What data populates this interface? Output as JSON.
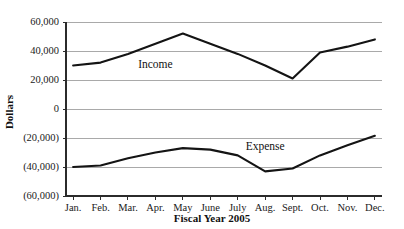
{
  "chart_data": {
    "type": "line",
    "title": "",
    "xlabel": "Fiscal Year 2005",
    "ylabel": "Dollars",
    "categories": [
      "Jan.",
      "Feb.",
      "Mar.",
      "Apr.",
      "May",
      "June",
      "July",
      "Aug.",
      "Sept.",
      "Oct.",
      "Nov.",
      "Dec."
    ],
    "ylim": [
      -60000,
      60000
    ],
    "ytick_values": [
      60000,
      40000,
      20000,
      0,
      -20000,
      -40000,
      -60000
    ],
    "ytick_labels": [
      "60,000",
      "40,000",
      "20,000",
      "0",
      "(20,000)",
      "(40,000)",
      "(60,000)"
    ],
    "grid": true,
    "legend": "inline-labels",
    "series": [
      {
        "name": "Income",
        "label_x_category": "Apr.",
        "label_value": 28000,
        "values": [
          30000,
          32000,
          38000,
          45000,
          52000,
          45000,
          38000,
          30000,
          21000,
          39000,
          43000,
          48000
        ]
      },
      {
        "name": "Expense",
        "label_x_category": "Aug.",
        "label_value": -28000,
        "values": [
          -40000,
          -39000,
          -34000,
          -30000,
          -27000,
          -28000,
          -32000,
          -43000,
          -41000,
          -32000,
          -25000,
          -18500
        ]
      }
    ]
  },
  "labels": {
    "y_axis_title": "Dollars",
    "x_axis_title": "Fiscal Year 2005",
    "income_label": "Income",
    "expense_label": "Expense"
  }
}
